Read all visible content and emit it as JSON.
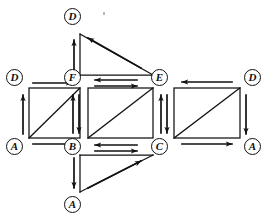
{
  "figure": {
    "type": "topological-net",
    "background": "#ffffff",
    "stroke_color": "#111111",
    "vertex_label_style": "italic-letter-in-circle"
  },
  "vertices": [
    {
      "id": "D-top",
      "label": "D",
      "x": 64,
      "y": 8
    },
    {
      "id": "D-left",
      "label": "D",
      "x": 6,
      "y": 69
    },
    {
      "id": "F",
      "label": "F",
      "x": 64,
      "y": 69
    },
    {
      "id": "E",
      "label": "E",
      "x": 151,
      "y": 69
    },
    {
      "id": "D-right",
      "label": "D",
      "x": 244,
      "y": 69
    },
    {
      "id": "A-left",
      "label": "A",
      "x": 6,
      "y": 138
    },
    {
      "id": "B",
      "label": "B",
      "x": 64,
      "y": 138
    },
    {
      "id": "C",
      "label": "C",
      "x": 151,
      "y": 138
    },
    {
      "id": "A-right",
      "label": "A",
      "x": 244,
      "y": 138
    },
    {
      "id": "A-bottom",
      "label": "A",
      "x": 64,
      "y": 196
    }
  ],
  "faces": [
    {
      "id": "top-triangle",
      "shape": "triangle",
      "vertices": [
        "D-top",
        "F",
        "E"
      ],
      "diagonal": "hypotenuse-D-to-E"
    },
    {
      "id": "left-square",
      "shape": "rectangle",
      "vertices": [
        "D-left",
        "F",
        "B",
        "A-left"
      ],
      "diagonal": "A-to-F"
    },
    {
      "id": "middle-rectangle",
      "shape": "rectangle",
      "vertices": [
        "F",
        "E",
        "C",
        "B"
      ],
      "diagonal": "B-to-E"
    },
    {
      "id": "right-rectangle",
      "shape": "rectangle",
      "vertices": [
        "E",
        "D-right",
        "A-right",
        "C"
      ],
      "diagonal": "C-to-D"
    },
    {
      "id": "bottom-triangle",
      "shape": "triangle",
      "vertices": [
        "B",
        "C",
        "A-bottom"
      ],
      "diagonal": "hypotenuse-A-to-C"
    }
  ],
  "edges": [
    {
      "id": "e-F-to-D",
      "from": "F",
      "to": "D-top",
      "direction": "up",
      "position": "top-triangle-left"
    },
    {
      "id": "e-E-to-D",
      "from": "E",
      "to": "D-top",
      "direction": "up-left",
      "position": "top-triangle-hypotenuse"
    },
    {
      "id": "e-E-to-F",
      "from": "E",
      "to": "F",
      "direction": "left",
      "position": "between-F-and-E-upper"
    },
    {
      "id": "e-F-to-E",
      "from": "F",
      "to": "E",
      "direction": "right",
      "position": "between-F-and-E-lower"
    },
    {
      "id": "e-D-to-F",
      "from": "D-left",
      "to": "F",
      "direction": "right",
      "position": "left-square-top"
    },
    {
      "id": "e-A-to-D",
      "from": "A-left",
      "to": "D-left",
      "direction": "up",
      "position": "left-square-left"
    },
    {
      "id": "e-A-to-B",
      "from": "A-left",
      "to": "B",
      "direction": "right",
      "position": "left-square-bottom"
    },
    {
      "id": "e-A-to-F-diag",
      "from": "A-left",
      "to": "F",
      "direction": "diagonal",
      "position": "left-square-diagonal"
    },
    {
      "id": "e-B-to-F",
      "from": "B",
      "to": "F",
      "direction": "up",
      "position": "between-F-and-B-left"
    },
    {
      "id": "e-F-to-B",
      "from": "F",
      "to": "B",
      "direction": "down",
      "position": "between-F-and-B-right"
    },
    {
      "id": "e-B-to-E-diag",
      "from": "B",
      "to": "E",
      "direction": "diagonal",
      "position": "middle-rectangle-diagonal"
    },
    {
      "id": "e-C-to-B",
      "from": "C",
      "to": "B",
      "direction": "left",
      "position": "between-B-and-C-upper"
    },
    {
      "id": "e-B-to-C",
      "from": "B",
      "to": "C",
      "direction": "right",
      "position": "between-B-and-C-lower"
    },
    {
      "id": "e-C-to-E",
      "from": "C",
      "to": "E",
      "direction": "up",
      "position": "between-E-and-C-left"
    },
    {
      "id": "e-E-to-C",
      "from": "E",
      "to": "C",
      "direction": "down",
      "position": "between-E-and-C-right"
    },
    {
      "id": "e-D-to-E",
      "from": "D-right",
      "to": "E",
      "direction": "left",
      "position": "right-rectangle-top"
    },
    {
      "id": "e-D-to-A",
      "from": "D-right",
      "to": "A-right",
      "direction": "down",
      "position": "right-rectangle-right"
    },
    {
      "id": "e-C-to-A",
      "from": "C",
      "to": "A-right",
      "direction": "right",
      "position": "right-rectangle-bottom"
    },
    {
      "id": "e-C-to-D-diag",
      "from": "C",
      "to": "D-right",
      "direction": "diagonal",
      "position": "right-rectangle-diagonal"
    },
    {
      "id": "e-B-to-A",
      "from": "B",
      "to": "A-bottom",
      "direction": "down",
      "position": "bottom-triangle-left"
    },
    {
      "id": "e-A-to-C",
      "from": "A-bottom",
      "to": "C",
      "direction": "up-right",
      "position": "bottom-triangle-hypotenuse"
    }
  ]
}
